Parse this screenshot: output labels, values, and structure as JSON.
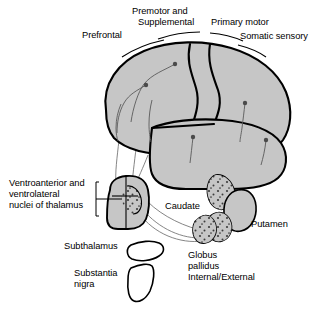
{
  "figure": {
    "background_color": "#ffffff",
    "stroke_color": "#000000",
    "fill_gray": "#c6c6c6",
    "fill_white": "#ffffff",
    "thin_line_color": "#6b6b6b"
  },
  "labels": {
    "prefrontal": "Prefrontal",
    "premotor_line1": "Premotor and",
    "premotor_line2": "Supplemental",
    "primary_motor": "Primary motor",
    "somatic_sensory": "Somatic sensory",
    "thalamus_line1": "Ventroanterior and",
    "thalamus_line2": "ventrolateral",
    "thalamus_line3": "nuclei of thalamus",
    "subthalamus": "Subthalamus",
    "substantia_line1": "Substantia",
    "substantia_line2": "nigra",
    "caudate": "Caudate",
    "putamen": "Putamen",
    "globus_line1": "Globus",
    "globus_line2": "pallidus",
    "globus_line3": "Internal/External"
  },
  "structures": [
    {
      "name": "cerebral-cortex",
      "label": "Cerebral cortex",
      "fill": "#c6c6c6"
    },
    {
      "name": "temporal-lobe",
      "label": "Temporal lobe",
      "fill": "#c6c6c6"
    },
    {
      "name": "thalamus",
      "label": "Ventroanterior and ventrolateral nuclei of thalamus",
      "fill": "#c6c6c6"
    },
    {
      "name": "subthalamus",
      "label": "Subthalamus",
      "fill": "#ffffff"
    },
    {
      "name": "substantia-nigra",
      "label": "Substantia nigra",
      "fill": "#ffffff"
    },
    {
      "name": "caudate",
      "label": "Caudate",
      "fill": "#c6c6c6"
    },
    {
      "name": "putamen",
      "label": "Putamen",
      "fill": "#c6c6c6"
    },
    {
      "name": "globus-pallidus-external",
      "label": "Globus pallidus External",
      "fill": "#c6c6c6"
    },
    {
      "name": "globus-pallidus-internal",
      "label": "Globus pallidus Internal",
      "fill": "#c6c6c6"
    }
  ],
  "cortical_regions": [
    {
      "name": "prefrontal",
      "label": "Prefrontal"
    },
    {
      "name": "premotor-supplemental",
      "label": "Premotor and Supplemental"
    },
    {
      "name": "primary-motor",
      "label": "Primary motor"
    },
    {
      "name": "somatic-sensory",
      "label": "Somatic sensory"
    }
  ]
}
